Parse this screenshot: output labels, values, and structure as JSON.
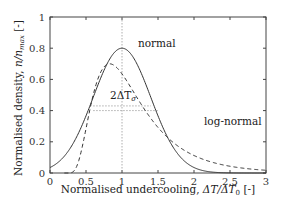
{
  "chart_data": {
    "type": "line",
    "title": "",
    "xlabel": "Normalised undercooling, ΔT/ΔT₀ [-]",
    "ylabel": "Normalised density, n/n_max [-]",
    "xlim": [
      0,
      3
    ],
    "ylim": [
      0,
      1
    ],
    "xticks": [
      "0",
      "0.5",
      "1",
      "1.5",
      "2",
      "2.5",
      "3"
    ],
    "yticks": [
      "0",
      "0.2",
      "0.4",
      "0.6",
      "0.8",
      "1"
    ],
    "grid": false,
    "legend": "none (inline curve labels)",
    "series": [
      {
        "name": "normal",
        "style": "solid",
        "x": [
          0,
          0.25,
          0.5,
          0.75,
          1.0,
          1.25,
          1.5,
          1.75,
          2.0,
          2.25,
          2.5,
          2.75,
          3.0
        ],
        "y": [
          0.108,
          0.23,
          0.42,
          0.67,
          0.8,
          0.67,
          0.42,
          0.23,
          0.108,
          0.043,
          0.015,
          0.004,
          0.001
        ]
      },
      {
        "name": "log-normal",
        "style": "dashed",
        "x": [
          0.2,
          0.3,
          0.4,
          0.5,
          0.6,
          0.8,
          1.0,
          1.2,
          1.4,
          1.6,
          1.8,
          2.0,
          2.25,
          2.5,
          2.75,
          3.0
        ],
        "y": [
          0.0,
          0.03,
          0.12,
          0.27,
          0.42,
          0.63,
          0.7,
          0.66,
          0.56,
          0.45,
          0.35,
          0.26,
          0.18,
          0.12,
          0.07,
          0.04
        ]
      }
    ],
    "annotations": [
      {
        "text": "normal",
        "x": 1.3,
        "y": 0.78
      },
      {
        "text": "log-normal",
        "x": 1.95,
        "y": 0.38
      },
      {
        "text": "2ΔT_σ",
        "x": 1.0,
        "y": 0.46
      }
    ],
    "reference_lines": [
      {
        "type": "vertical",
        "x": 1.0,
        "style": "dotted"
      },
      {
        "type": "horizontal",
        "y": 0.43,
        "x_range": [
          0.6,
          1.4
        ],
        "style": "dotted"
      },
      {
        "type": "horizontal",
        "y": 0.4,
        "x_range": [
          0.6,
          1.5
        ],
        "style": "dotted"
      }
    ]
  },
  "labels": {
    "xlabel_main": "Normalised undercooling, ",
    "xlabel_math": "ΔT/ΔT",
    "xlabel_sub": "0",
    "xlabel_unit": " [-]",
    "ylabel_main": "Normalised density, ",
    "ylabel_math": "n/n",
    "ylabel_sub": "max",
    "ylabel_unit": " [-]",
    "normal_label": "normal",
    "lognormal_label": "log-normal",
    "sigma_label_pre": "2ΔT",
    "sigma_label_sub": "σ"
  }
}
